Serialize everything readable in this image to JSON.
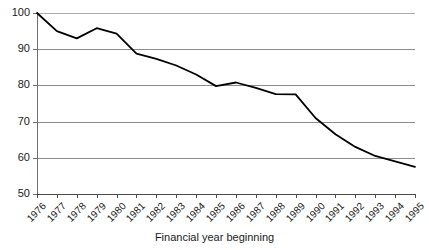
{
  "chart_data": {
    "type": "line",
    "title": "",
    "subtitle": "",
    "xlabel": "Financial year beginning",
    "ylabel": "",
    "categories": [
      "1976",
      "1977",
      "1978",
      "1979",
      "1980",
      "1981",
      "1982",
      "1983",
      "1984",
      "1985",
      "1986",
      "1987",
      "1988",
      "1989",
      "1990",
      "1991",
      "1992",
      "1993",
      "1994",
      "1995"
    ],
    "values": [
      100,
      95,
      93,
      95.8,
      94.3,
      88.8,
      87.3,
      85.5,
      83,
      79.8,
      80.8,
      79.3,
      77.6,
      77.5,
      71,
      66.5,
      63,
      60.5,
      59,
      57.5
    ],
    "series": [
      {
        "name": "Index",
        "values": [
          100,
          95,
          93,
          95.8,
          94.3,
          88.8,
          87.3,
          85.5,
          83,
          79.8,
          80.8,
          79.3,
          77.6,
          77.5,
          71,
          66.5,
          63,
          60.5,
          59,
          57.5
        ]
      }
    ],
    "ylim": [
      50,
      100
    ],
    "ytick_labels": [
      "100",
      "90",
      "80",
      "70",
      "60",
      "50"
    ],
    "ytick_values": [
      100,
      90,
      80,
      70,
      60,
      50
    ],
    "xlim": [
      "1976",
      "1995"
    ],
    "grid": "horizontal",
    "legend": "none",
    "line_color": "#000000",
    "gridline_color": "#8d8d8d",
    "axis_color": "#4a4a4a",
    "background_color": "#ffffff",
    "markers": "none",
    "annotations": []
  }
}
